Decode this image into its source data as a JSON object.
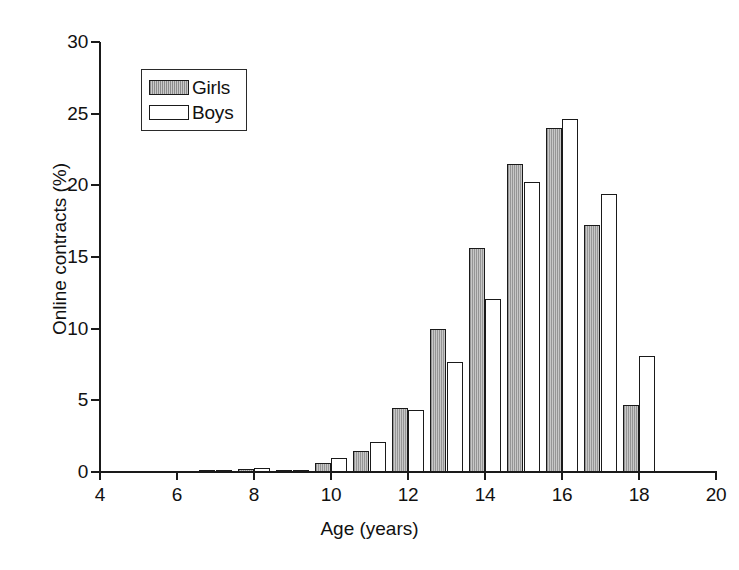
{
  "chart_data": {
    "type": "bar",
    "title": "",
    "xlabel": "Age (years)",
    "ylabel": "Online contracts (%)",
    "xlim": [
      4,
      20
    ],
    "ylim": [
      0,
      30
    ],
    "ytick_labels": [
      "0",
      "5",
      "10",
      "15",
      "20",
      "25",
      "30"
    ],
    "yticks": [
      0,
      5,
      10,
      15,
      20,
      25,
      30
    ],
    "xtick_labels": [
      "4",
      "6",
      "8",
      "10",
      "12",
      "14",
      "16",
      "18",
      "20"
    ],
    "xticks": [
      4,
      6,
      8,
      10,
      12,
      14,
      16,
      18,
      20
    ],
    "grid": false,
    "legend_position": "upper left",
    "categories": [
      7,
      8,
      9,
      10,
      11,
      12,
      13,
      14,
      15,
      16,
      17,
      18
    ],
    "series": [
      {
        "name": "Girls",
        "color": "#b8b8b8",
        "values": [
          0.1,
          0.2,
          0.1,
          0.6,
          1.5,
          4.5,
          10.0,
          15.6,
          21.5,
          24.0,
          17.2,
          4.7
        ]
      },
      {
        "name": "Boys",
        "color": "#ffffff",
        "values": [
          0.0,
          0.3,
          0.05,
          1.0,
          2.1,
          4.3,
          7.7,
          12.1,
          20.2,
          24.6,
          19.4,
          8.1
        ]
      }
    ]
  },
  "legend": {
    "items": [
      {
        "label": "Girls"
      },
      {
        "label": "Boys"
      }
    ]
  }
}
